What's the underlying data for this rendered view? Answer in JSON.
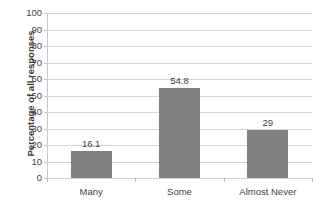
{
  "chart_data": {
    "type": "bar",
    "title": "",
    "xlabel": "",
    "ylabel": "Percentage of all responses",
    "categories": [
      "Many",
      "Some",
      "Almost Never"
    ],
    "values": [
      16.1,
      54.8,
      29
    ],
    "data_labels": [
      "16.1",
      "54.8",
      "29"
    ],
    "ylim": [
      0,
      100
    ],
    "ytick_step": 10,
    "yticks": [
      100,
      90,
      80,
      70,
      60,
      50,
      40,
      30,
      20,
      10,
      0
    ],
    "ytick_labels": [
      "100",
      "90",
      "80",
      "70",
      "60",
      "50",
      "40",
      "30",
      "20",
      "10",
      "0"
    ],
    "grid": "horizontal",
    "legend": "none",
    "series": [
      {
        "name": "Percentage of all responses",
        "values": [
          16.1,
          54.8,
          29
        ]
      }
    ],
    "colors": {
      "bar": "#808080",
      "gridline": "#d4d4d4",
      "axis": "#bdbdbd",
      "text": "#3f3f3f",
      "background": "#ffffff"
    }
  }
}
